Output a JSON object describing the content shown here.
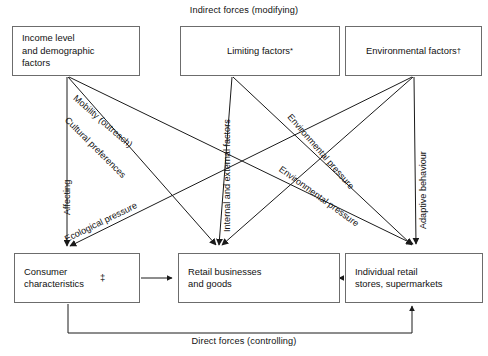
{
  "diagram": {
    "title_top": "Indirect forces (modifying)",
    "title_bottom": "Direct forces (controlling)",
    "nodes": {
      "income": {
        "label": "Income level\nand demographic\nfactors"
      },
      "limiting": {
        "label": "Limiting factors",
        "marker": "*"
      },
      "environ": {
        "label": "Environmental factors",
        "marker": "†"
      },
      "consumer": {
        "label": "Consumer\ncharacteristics",
        "marker": "‡"
      },
      "retail": {
        "label": "Retail businesses\nand goods"
      },
      "stores": {
        "label": "Individual retail\nstores, supermarkets"
      }
    },
    "edge_labels": {
      "affecting": "Affecting",
      "mobility": "Mobility (outreach)",
      "cultural": "Cultural preferences",
      "ecological": "Ecological pressure",
      "internal_external": "Internal and external factors",
      "environmental_pressure_1": "Environmental pressure",
      "environmental_pressure_2": "Environmental pressure",
      "adaptive": "Adaptive behaviour"
    },
    "colors": {
      "line": "#1a1a1a",
      "box_border": "#6c6c6c",
      "background": "#ffffff",
      "text": "#111111"
    }
  }
}
